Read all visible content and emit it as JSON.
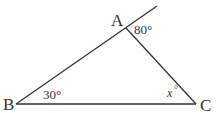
{
  "diagram": {
    "type": "triangle",
    "stroke_color": "#333333",
    "background": "#ffffff",
    "vertices": [
      {
        "label": "A",
        "x": 126,
        "y": 28
      },
      {
        "label": "B",
        "x": 16,
        "y": 104
      },
      {
        "label": "C",
        "x": 196,
        "y": 104
      }
    ],
    "edges": [
      {
        "from": "B",
        "to": "A",
        "extended_past": "A"
      },
      {
        "from": "A",
        "to": "C"
      },
      {
        "from": "B",
        "to": "C"
      }
    ],
    "angles": {
      "A_exterior": "80°",
      "B": "30°",
      "C": "x°"
    },
    "labels": {
      "A": "A",
      "B": "B",
      "C": "C",
      "angle_A": "80°",
      "angle_B": "30°",
      "angle_C_var": "x",
      "angle_C_deg": "°"
    }
  }
}
